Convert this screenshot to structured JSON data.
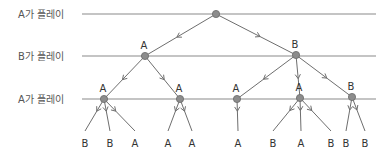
{
  "diagram": {
    "type": "game-tree",
    "rows": [
      {
        "label": "A가 플레이",
        "y": 14,
        "x1": 82,
        "x2": 376
      },
      {
        "label": "B가 플레이",
        "y": 56,
        "x1": 82,
        "x2": 376
      },
      {
        "label": "A가 플레이",
        "y": 99,
        "x1": 82,
        "x2": 376
      }
    ],
    "nodes": [
      {
        "id": "root",
        "x": 216,
        "y": 14,
        "label": ""
      },
      {
        "id": "n1",
        "x": 145,
        "y": 56,
        "label": "A"
      },
      {
        "id": "n2",
        "x": 296,
        "y": 55,
        "label": "B"
      },
      {
        "id": "n11",
        "x": 104,
        "y": 99,
        "label": "A"
      },
      {
        "id": "n12",
        "x": 180,
        "y": 99,
        "label": "A"
      },
      {
        "id": "n21",
        "x": 237,
        "y": 99,
        "label": "A"
      },
      {
        "id": "n22",
        "x": 300,
        "y": 98,
        "label": "A"
      },
      {
        "id": "n23",
        "x": 352,
        "y": 97,
        "label": "B"
      }
    ],
    "leaves": [
      {
        "parent": "n11",
        "x": 85,
        "label": "B"
      },
      {
        "parent": "n11",
        "x": 110,
        "label": "B"
      },
      {
        "parent": "n11",
        "x": 135,
        "label": "A"
      },
      {
        "parent": "n12",
        "x": 168,
        "label": "A"
      },
      {
        "parent": "n12",
        "x": 192,
        "label": "A"
      },
      {
        "parent": "n21",
        "x": 238,
        "label": "A"
      },
      {
        "parent": "n22",
        "x": 273,
        "label": "B"
      },
      {
        "parent": "n22",
        "x": 301,
        "label": "A"
      },
      {
        "parent": "n22",
        "x": 331,
        "label": "B"
      },
      {
        "parent": "n23",
        "x": 346,
        "label": "B"
      },
      {
        "parent": "n23",
        "x": 365,
        "label": "B"
      }
    ],
    "leaf_y": 143,
    "edges": [
      [
        "root",
        "n1"
      ],
      [
        "root",
        "n2"
      ],
      [
        "n1",
        "n11"
      ],
      [
        "n1",
        "n12"
      ],
      [
        "n2",
        "n21"
      ],
      [
        "n2",
        "n22"
      ],
      [
        "n2",
        "n23"
      ]
    ]
  }
}
